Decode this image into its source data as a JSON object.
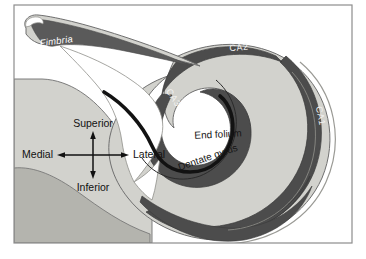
{
  "figure": {
    "name": "hippocampus-coronal-diagram"
  },
  "palette": {
    "page_background": "#ffffff",
    "frame_border": "#8d8d8d",
    "light_gray": "#d2d2cd",
    "mid_gray": "#b4b4ae",
    "dark_band": "#4c4c4c",
    "black_line": "#121212",
    "white_fill": "#ffffff",
    "outline": "#6f6f6f",
    "label_white": "#ffffff",
    "label_black": "#161616"
  },
  "labels": {
    "fimbria": "Fimbria",
    "ca1": "CA1",
    "ca2": "CA2",
    "ca3": "CA3",
    "end_folium": "End folium",
    "dentate_gyrus": "Dentate gyrus"
  },
  "compass": {
    "superior": "Superior",
    "inferior": "Inferior",
    "medial": "Medial",
    "lateral": "Lateral"
  }
}
